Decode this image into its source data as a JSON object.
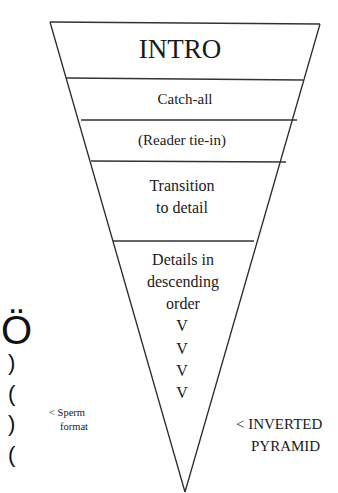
{
  "diagram": {
    "colors": {
      "background": "#ffffff",
      "ink": "#1a1a1a"
    },
    "pyramid": {
      "sections": [
        {
          "id": "intro",
          "lines": [
            "INTRO"
          ]
        },
        {
          "id": "catch-all",
          "lines": [
            "Catch-all"
          ]
        },
        {
          "id": "reader-tie-in",
          "lines": [
            "(Reader tie-in)"
          ]
        },
        {
          "id": "transition",
          "lines": [
            "Transition",
            "to detail"
          ]
        },
        {
          "id": "details",
          "lines": [
            "Details in",
            "descending",
            "order",
            "V",
            "V",
            "V",
            "V"
          ]
        }
      ]
    },
    "labels": {
      "inverted_pyramid": [
        "< INVERTED",
        "PYRAMID"
      ],
      "sperm_format": [
        "< Sperm",
        "format"
      ]
    },
    "sperm_glyph": {
      "head": "Ö",
      "tail": [
        ")",
        "(",
        ")",
        "("
      ]
    }
  }
}
